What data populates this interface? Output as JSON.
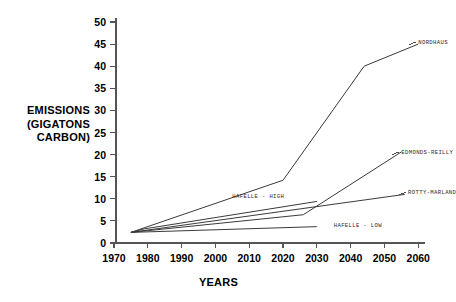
{
  "chart_data": {
    "type": "line",
    "title": "",
    "xlabel": "YEARS",
    "ylabel": "EMISSIONS\n(GIGATONS\nCARBON)",
    "ylabel_lines": [
      "EMISSIONS",
      "(GIGATONS",
      "CARBON)"
    ],
    "xlim": [
      1970,
      2062
    ],
    "ylim": [
      0,
      50
    ],
    "xticks": [
      1970,
      1980,
      1990,
      2000,
      2010,
      2020,
      2030,
      2040,
      2050,
      2060
    ],
    "yticks": [
      0,
      5,
      10,
      15,
      20,
      25,
      30,
      35,
      40,
      45,
      50
    ],
    "xtick_labels": [
      "1970",
      "1980",
      "1990",
      "2000",
      "2010",
      "2020",
      "2030",
      "2040",
      "2050",
      "2060"
    ],
    "ytick_labels": [
      "0",
      "5",
      "10",
      "15",
      "20",
      "25",
      "30",
      "35",
      "40",
      "45",
      "50"
    ],
    "grid": false,
    "legend_position": "inline-right-of-line-ends",
    "line_color": "#3a3a3a",
    "axis_color": "#555555",
    "series": [
      {
        "name": "NORDHAUS",
        "label": "NORDHAUS",
        "label_x": 2060,
        "label_y": 45.2,
        "x": [
          1975,
          2020,
          2044,
          2060
        ],
        "y": [
          2.4,
          14.2,
          40.0,
          45.0
        ]
      },
      {
        "name": "EDMONDS-REILLY",
        "label": "EDMONDS-REILLY",
        "label_x": 2055,
        "label_y": 20.3,
        "x": [
          1975,
          2026,
          2055
        ],
        "y": [
          2.4,
          6.4,
          20.6
        ]
      },
      {
        "name": "ROTTY-MARLAND",
        "label": "ROTTY-MARLAND",
        "label_x": 2057,
        "label_y": 11.2,
        "x": [
          1975,
          2056
        ],
        "y": [
          2.4,
          11.0
        ]
      },
      {
        "name": "HAFELLE-HIGH",
        "label": "HAFELLE - HIGH",
        "label_x": 2005,
        "label_y": 10.4,
        "x": [
          1975,
          1979,
          2030
        ],
        "y": [
          2.4,
          3.2,
          9.4
        ]
      },
      {
        "name": "HAFELLE-LOW",
        "label": "HAFELLE - LOW",
        "label_x": 2035,
        "label_y": 3.8,
        "x": [
          1975,
          2030
        ],
        "y": [
          2.4,
          3.7
        ]
      }
    ]
  }
}
